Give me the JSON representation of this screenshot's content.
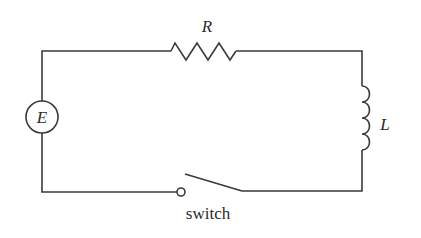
{
  "diagram": {
    "type": "circuit",
    "components": {
      "source": {
        "label": "E",
        "kind": "emf-source"
      },
      "resistor": {
        "label": "R",
        "kind": "resistor"
      },
      "inductor": {
        "label": "L",
        "kind": "inductor"
      },
      "switch": {
        "label": "switch",
        "kind": "switch",
        "state": "open"
      }
    },
    "colors": {
      "line": "#3a3a3a",
      "text": "#2a2a2a",
      "background": "#ffffff"
    }
  }
}
